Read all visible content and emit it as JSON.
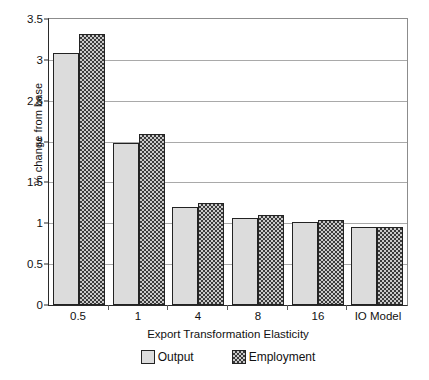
{
  "chart_data": {
    "type": "bar",
    "title": "",
    "subtitle": "",
    "xlabel": "Export Transformation Elasticity",
    "ylabel": "% change from base",
    "categories": [
      "0.5",
      "1",
      "4",
      "8",
      "16",
      "IO Model"
    ],
    "series": [
      {
        "name": "Output",
        "color": "#dcdcdc",
        "values": [
          3.09,
          1.98,
          1.2,
          1.07,
          1.02,
          0.96
        ]
      },
      {
        "name": "Employment",
        "color": "#6e6e6e",
        "values": [
          3.32,
          2.09,
          1.25,
          1.1,
          1.04,
          0.96
        ]
      }
    ],
    "ylim": [
      0,
      3.5
    ],
    "yticks": [
      0,
      0.5,
      1,
      1.5,
      2,
      2.5,
      3,
      3.5
    ],
    "ytick_labels": [
      "0",
      "0.5",
      "1",
      "1.5",
      "2",
      "2.5",
      "3",
      "3.5"
    ],
    "grid": true,
    "legend_position": "bottom",
    "legend": [
      "Output",
      "Employment"
    ]
  }
}
